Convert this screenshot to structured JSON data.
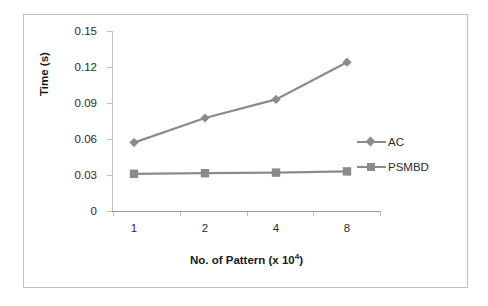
{
  "chart_data": {
    "type": "line",
    "title": "",
    "xlabel": "No. of Pattern (x 10⁴)",
    "xlabel_base": "No. of Pattern (x 10",
    "xlabel_sup": "4",
    "xlabel_tail": ")",
    "ylabel": "Time (s)",
    "categories": [
      "1",
      "2",
      "4",
      "8"
    ],
    "x_tick_labels": [
      "1",
      "2",
      "4",
      "8"
    ],
    "y_tick_labels": [
      "0.15",
      "0.12",
      "0.09",
      "0.06",
      "0.03",
      "0"
    ],
    "y_ticks": [
      0.15,
      0.12,
      0.09,
      0.06,
      0.03,
      0
    ],
    "ylim": [
      0,
      0.15
    ],
    "grid": false,
    "legend_position": "right",
    "series": [
      {
        "name": "AC",
        "marker": "diamond",
        "color": "#8b8b8b",
        "values": [
          0.057,
          0.0775,
          0.093,
          0.124
        ]
      },
      {
        "name": "PSMBD",
        "marker": "square",
        "color": "#8b8b8b",
        "values": [
          0.031,
          0.0315,
          0.032,
          0.033
        ]
      }
    ]
  },
  "legend": {
    "items": [
      {
        "label": "AC",
        "marker": "diamond"
      },
      {
        "label": "PSMBD",
        "marker": "square"
      }
    ]
  },
  "colors": {
    "series": "#8b8b8b",
    "axis": "#bfbfbf",
    "frame": "#bfbfbf",
    "text": "#2b2b2b"
  }
}
